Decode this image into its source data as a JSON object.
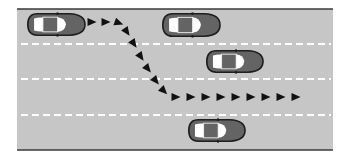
{
  "diagram": {
    "colors": {
      "background": "#ffffff",
      "road": "#c6c6c6",
      "road_edge": "#3a3a3a",
      "lane_marking": "#ffffff",
      "car_body": "#646464",
      "car_outline": "#1e1e1e",
      "car_window": "#ffffff",
      "arrow": "#111111"
    },
    "road": {
      "x": 17,
      "y": 9,
      "width": 316,
      "height": 141
    },
    "lane_lines_y": [
      44,
      79,
      115
    ],
    "cars": [
      {
        "id": "ego",
        "x": 27,
        "y": 13,
        "w": 59,
        "h": 23
      },
      {
        "id": "lane1-ahead",
        "x": 162,
        "y": 13,
        "w": 59,
        "h": 24
      },
      {
        "id": "lane2",
        "x": 206,
        "y": 50,
        "w": 58,
        "h": 23
      },
      {
        "id": "lane4",
        "x": 188,
        "y": 119,
        "w": 58,
        "h": 23
      }
    ],
    "path_arrows": [
      {
        "x": 92,
        "y": 22,
        "angle": 0
      },
      {
        "x": 106,
        "y": 22,
        "angle": 0
      },
      {
        "x": 119,
        "y": 23,
        "angle": 20
      },
      {
        "x": 127,
        "y": 32,
        "angle": 55
      },
      {
        "x": 134,
        "y": 44,
        "angle": 55
      },
      {
        "x": 141,
        "y": 57,
        "angle": 55
      },
      {
        "x": 148,
        "y": 69,
        "angle": 50
      },
      {
        "x": 156,
        "y": 81,
        "angle": 50
      },
      {
        "x": 164,
        "y": 91,
        "angle": 45
      },
      {
        "x": 176,
        "y": 97,
        "angle": 0
      },
      {
        "x": 191,
        "y": 97,
        "angle": 0
      },
      {
        "x": 206,
        "y": 97,
        "angle": 0
      },
      {
        "x": 221,
        "y": 97,
        "angle": 0
      },
      {
        "x": 236,
        "y": 97,
        "angle": 0
      },
      {
        "x": 251,
        "y": 97,
        "angle": 0
      },
      {
        "x": 266,
        "y": 97,
        "angle": 0
      },
      {
        "x": 281,
        "y": 97,
        "angle": 0
      },
      {
        "x": 296,
        "y": 97,
        "angle": 0
      }
    ]
  }
}
